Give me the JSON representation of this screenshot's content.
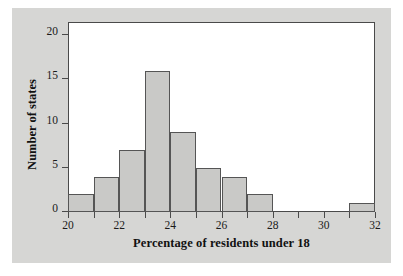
{
  "chart_data": {
    "type": "bar",
    "title": "",
    "subtitle": "",
    "xlabel": "Percentage of residents under 18",
    "ylabel": "Number of states",
    "xlim": [
      20,
      32
    ],
    "ylim": [
      0,
      21.5
    ],
    "grid": false,
    "legend": null,
    "bin_width": 1,
    "bins": [
      {
        "start": 20,
        "end": 21,
        "count": 2
      },
      {
        "start": 21,
        "end": 22,
        "count": 4
      },
      {
        "start": 22,
        "end": 23,
        "count": 7
      },
      {
        "start": 23,
        "end": 24,
        "count": 16
      },
      {
        "start": 24,
        "end": 25,
        "count": 9
      },
      {
        "start": 25,
        "end": 26,
        "count": 5
      },
      {
        "start": 26,
        "end": 27,
        "count": 4
      },
      {
        "start": 27,
        "end": 28,
        "count": 2
      },
      {
        "start": 28,
        "end": 29,
        "count": 0
      },
      {
        "start": 29,
        "end": 30,
        "count": 0
      },
      {
        "start": 30,
        "end": 31,
        "count": 0
      },
      {
        "start": 31,
        "end": 32,
        "count": 1
      }
    ],
    "categories": [
      "20-21",
      "21-22",
      "22-23",
      "23-24",
      "24-25",
      "25-26",
      "26-27",
      "27-28",
      "28-29",
      "29-30",
      "30-31",
      "31-32"
    ],
    "values": [
      2,
      4,
      7,
      16,
      9,
      5,
      4,
      2,
      0,
      0,
      0,
      1
    ],
    "x_ticks": [
      {
        "value": 20,
        "label": "20",
        "major": true
      },
      {
        "value": 21,
        "label": "",
        "major": false
      },
      {
        "value": 22,
        "label": "22",
        "major": true
      },
      {
        "value": 23,
        "label": "",
        "major": false
      },
      {
        "value": 24,
        "label": "24",
        "major": true
      },
      {
        "value": 25,
        "label": "",
        "major": false
      },
      {
        "value": 26,
        "label": "26",
        "major": true
      },
      {
        "value": 27,
        "label": "",
        "major": false
      },
      {
        "value": 28,
        "label": "28",
        "major": true
      },
      {
        "value": 29,
        "label": "",
        "major": false
      },
      {
        "value": 30,
        "label": "30",
        "major": true
      },
      {
        "value": 31,
        "label": "",
        "major": false
      },
      {
        "value": 32,
        "label": "32",
        "major": true
      }
    ],
    "y_ticks": [
      {
        "value": 0,
        "label": "0"
      },
      {
        "value": 5,
        "label": "5"
      },
      {
        "value": 10,
        "label": "10"
      },
      {
        "value": 15,
        "label": "15"
      },
      {
        "value": 20,
        "label": "20"
      }
    ],
    "colors": {
      "bar_fill": "#c9c9c7",
      "bar_edge": "#555555",
      "plot_background": "#ffffff",
      "page_background": "#d6d6d4",
      "axis": "#4a4a4a",
      "text": "#111111"
    }
  }
}
